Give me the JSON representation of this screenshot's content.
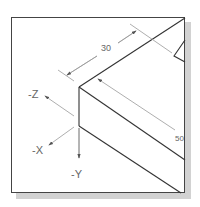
{
  "figure": {
    "type": "isometric-view",
    "dimensions": [
      {
        "label": "30",
        "id": "dim-width"
      },
      {
        "label": "50",
        "id": "dim-depth"
      }
    ],
    "axes": [
      {
        "label": "-Z"
      },
      {
        "label": "-X"
      },
      {
        "label": "-Y"
      }
    ]
  },
  "colors": {
    "line": "#333333",
    "dimension": "#888888",
    "shadow": "#d2d2d2"
  }
}
